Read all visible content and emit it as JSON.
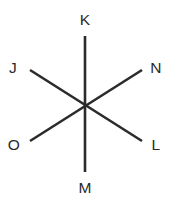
{
  "figure": {
    "background_color": "#ffffff",
    "line_color": "#2b2b2b",
    "label_color": "#2b2b2b",
    "stroke_width": 2.6,
    "canvas": {
      "width": 172,
      "height": 204
    },
    "center_point": {
      "x": 85,
      "y": 105
    },
    "labels": [
      {
        "id": "K",
        "text": "K",
        "x": 85,
        "y": 20,
        "position": "top"
      },
      {
        "id": "J",
        "text": "J",
        "x": 13,
        "y": 68,
        "position": "upper-left"
      },
      {
        "id": "N",
        "text": "N",
        "x": 156,
        "y": 68,
        "position": "upper-right"
      },
      {
        "id": "O",
        "text": "O",
        "x": 14,
        "y": 145,
        "position": "lower-left"
      },
      {
        "id": "L",
        "text": "L",
        "x": 156,
        "y": 145,
        "position": "lower-right"
      },
      {
        "id": "M",
        "text": "M",
        "x": 85,
        "y": 188,
        "position": "bottom"
      }
    ],
    "lines": [
      {
        "id": "line-KM",
        "name": "vertical-line",
        "endpoint_labels": [
          "K",
          "M"
        ],
        "x1": 85,
        "y1": 36,
        "x2": 85,
        "y2": 172
      },
      {
        "id": "line-JL",
        "name": "diagonal-line-upper-left-to-lower-right",
        "endpoint_labels": [
          "J",
          "L"
        ],
        "x1": 30,
        "y1": 70,
        "x2": 142,
        "y2": 141
      },
      {
        "id": "line-NO",
        "name": "diagonal-line-upper-right-to-lower-left",
        "endpoint_labels": [
          "N",
          "O"
        ],
        "x1": 142,
        "y1": 70,
        "x2": 30,
        "y2": 141
      }
    ]
  }
}
